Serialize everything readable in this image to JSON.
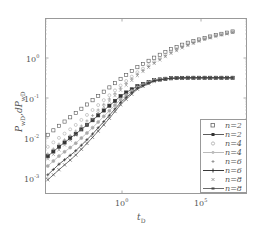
{
  "chart_data": {
    "type": "scatter",
    "title": "",
    "xlabel": "t_D",
    "ylabel": "P_wD,dP_wD",
    "xscale": "log",
    "yscale": "log",
    "xlim": [
      1e-05,
      100000000.0
    ],
    "ylim": [
      0.0005,
      10.0
    ],
    "x_ticks": [
      "10^0",
      "10^5"
    ],
    "y_ticks": [
      "10^-3",
      "10^-2",
      "10^-1",
      "10^0"
    ],
    "grid": false,
    "legend_position": "lower right",
    "legend": [
      {
        "label": "n=2",
        "style": "open-square markers",
        "color": "#555555"
      },
      {
        "label": "n=2",
        "style": "line with filled square markers",
        "color": "#333333"
      },
      {
        "label": "n=4",
        "style": "open-circle markers",
        "color": "#aaaaaa"
      },
      {
        "label": "n=4",
        "style": "line with circle markers",
        "color": "#aaaaaa"
      },
      {
        "label": "n=6",
        "style": "plus markers",
        "color": "#888888"
      },
      {
        "label": "n=6",
        "style": "line with plus markers",
        "color": "#222222"
      },
      {
        "label": "n=8",
        "style": "x markers",
        "color": "#888888"
      },
      {
        "label": "n=8",
        "style": "line with x markers",
        "color": "#444444"
      }
    ],
    "series": [
      {
        "name": "n=2 (P_wD)",
        "kind": "pressure",
        "x": [
          2e-05,
          0.0001,
          0.001,
          0.01,
          0.1,
          1,
          10,
          100,
          1000,
          10000,
          100000,
          1000000,
          10000000
        ],
        "y": [
          0.012,
          0.02,
          0.04,
          0.08,
          0.16,
          0.32,
          0.6,
          1.0,
          1.6,
          2.3,
          3.0,
          3.8,
          4.6
        ]
      },
      {
        "name": "n=2 (dP_wD)",
        "kind": "derivative",
        "x": [
          2e-05,
          0.0001,
          0.001,
          0.01,
          0.1,
          1,
          10,
          100,
          1000,
          10000,
          100000,
          1000000,
          10000000
        ],
        "y": [
          0.0035,
          0.006,
          0.012,
          0.025,
          0.055,
          0.12,
          0.2,
          0.28,
          0.31,
          0.32,
          0.32,
          0.32,
          0.32
        ]
      },
      {
        "name": "n=4 (P_wD)",
        "kind": "pressure",
        "x": [
          2e-05,
          0.0001,
          0.001,
          0.01,
          0.1,
          1,
          10,
          100,
          1000,
          10000,
          100000,
          1000000,
          10000000
        ],
        "y": [
          0.006,
          0.01,
          0.02,
          0.045,
          0.1,
          0.22,
          0.45,
          0.8,
          1.4,
          2.1,
          2.9,
          3.7,
          4.5
        ]
      },
      {
        "name": "n=4 (dP_wD)",
        "kind": "derivative",
        "x": [
          2e-05,
          0.0001,
          0.001,
          0.01,
          0.1,
          1,
          10,
          100,
          1000,
          10000,
          100000,
          1000000,
          10000000
        ],
        "y": [
          0.002,
          0.0035,
          0.007,
          0.016,
          0.04,
          0.1,
          0.19,
          0.28,
          0.31,
          0.32,
          0.32,
          0.32,
          0.32
        ]
      },
      {
        "name": "n=6 (P_wD)",
        "kind": "pressure",
        "x": [
          2e-05,
          0.0001,
          0.001,
          0.01,
          0.1,
          1,
          10,
          100,
          1000,
          10000,
          100000,
          1000000,
          10000000
        ],
        "y": [
          0.004,
          0.007,
          0.014,
          0.032,
          0.08,
          0.19,
          0.4,
          0.75,
          1.3,
          2.0,
          2.8,
          3.6,
          4.4
        ]
      },
      {
        "name": "n=6 (dP_wD)",
        "kind": "derivative",
        "x": [
          2e-05,
          0.0001,
          0.001,
          0.01,
          0.1,
          1,
          10,
          100,
          1000,
          10000,
          100000,
          1000000,
          10000000
        ],
        "y": [
          0.0012,
          0.0022,
          0.0045,
          0.011,
          0.03,
          0.085,
          0.18,
          0.27,
          0.31,
          0.32,
          0.32,
          0.32,
          0.32
        ]
      },
      {
        "name": "n=8 (P_wD)",
        "kind": "pressure",
        "x": [
          2e-05,
          0.0001,
          0.001,
          0.01,
          0.1,
          1,
          10,
          100,
          1000,
          10000,
          100000,
          1000000,
          10000000
        ],
        "y": [
          0.003,
          0.005,
          0.011,
          0.026,
          0.07,
          0.17,
          0.37,
          0.72,
          1.25,
          1.95,
          2.75,
          3.55,
          4.35
        ]
      },
      {
        "name": "n=8 (dP_wD)",
        "kind": "derivative",
        "x": [
          2e-05,
          0.0001,
          0.001,
          0.01,
          0.1,
          1,
          10,
          100,
          1000,
          10000,
          100000,
          1000000,
          10000000
        ],
        "y": [
          0.0009,
          0.0016,
          0.0035,
          0.009,
          0.025,
          0.075,
          0.17,
          0.26,
          0.31,
          0.32,
          0.32,
          0.32,
          0.32
        ]
      }
    ]
  },
  "axes": {
    "x_label_main": "t",
    "x_label_sub": "D",
    "y_label_main1": "P",
    "y_label_sub1": "wD",
    "y_label_mid": ",dP",
    "y_label_sub2": "wD",
    "x_tick_base": "10",
    "x_tick_exps": [
      "0",
      "5"
    ],
    "y_tick_base": "10",
    "y_tick_exps": [
      "0",
      "-1",
      "-2",
      "-3"
    ]
  },
  "legend": {
    "labels": [
      "n=2",
      "n=2",
      "n=4",
      "n=4",
      "n=6",
      "n=6",
      "n=8",
      "n=8"
    ]
  }
}
